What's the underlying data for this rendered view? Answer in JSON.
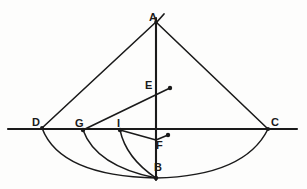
{
  "figure": {
    "canvas": {
      "width": 307,
      "height": 189
    },
    "colors": {
      "ink": "#1a1a1a",
      "background": "#fdfdfc"
    },
    "points": [
      {
        "id": "A",
        "label": "A",
        "x": 156,
        "y": 22,
        "label_x": 149,
        "label_y": 12,
        "role": "apex"
      },
      {
        "id": "D",
        "label": "D",
        "x": 42,
        "y": 128,
        "label_x": 32,
        "label_y": 117,
        "role": "left-end"
      },
      {
        "id": "C",
        "label": "C",
        "x": 268,
        "y": 129,
        "label_x": 271,
        "label_y": 117,
        "role": "right-end"
      },
      {
        "id": "G",
        "label": "G",
        "x": 83,
        "y": 130,
        "label_x": 75,
        "label_y": 118,
        "role": "arc-foot"
      },
      {
        "id": "I",
        "label": "I",
        "x": 120,
        "y": 130,
        "label_x": 117,
        "label_y": 118,
        "role": "arc-foot"
      },
      {
        "id": "E",
        "label": "E",
        "x": 170,
        "y": 88,
        "label_x": 145,
        "label_y": 80,
        "role": "ray-end"
      },
      {
        "id": "F",
        "label": "F",
        "x": 168,
        "y": 135,
        "label_x": 156,
        "label_y": 140,
        "role": "ray-end"
      },
      {
        "id": "B",
        "label": "B",
        "x": 156,
        "y": 178,
        "label_x": 154,
        "label_y": 162,
        "role": "bottom"
      }
    ],
    "segments": [
      {
        "name": "horizontal-baseline",
        "from": [
          8,
          129
        ],
        "to": [
          297,
          129
        ]
      },
      {
        "name": "vertical-axis",
        "from": [
          156,
          18
        ],
        "to": [
          156,
          180
        ]
      },
      {
        "name": "side-AD",
        "from": [
          156,
          22
        ],
        "to": [
          42,
          128
        ]
      },
      {
        "name": "side-AC",
        "from": [
          156,
          22
        ],
        "to": [
          268,
          129
        ]
      },
      {
        "name": "ray-G-to-E",
        "from": [
          83,
          130
        ],
        "to": [
          170,
          88
        ]
      },
      {
        "name": "segment-I-to-B-foot",
        "from": [
          120,
          130
        ],
        "to": [
          156,
          140
        ]
      },
      {
        "name": "segment-Bfoot-to-F",
        "from": [
          156,
          140
        ],
        "to": [
          168,
          135
        ]
      },
      {
        "name": "tick-at-A",
        "from": [
          156,
          23
        ],
        "to": [
          164,
          14
        ]
      }
    ],
    "arcs": [
      {
        "name": "arc-D-B-C",
        "d": "M 42 128 Q 60 176 156 178 Q 245 176 268 129"
      },
      {
        "name": "arc-G-B",
        "d": "M 83 130 Q 96 166 156 178"
      },
      {
        "name": "arc-I-B",
        "d": "M 120 130 Q 126 158 156 178"
      }
    ],
    "dots": [
      {
        "name": "dot-A",
        "x": 156,
        "y": 22,
        "r": 1.8
      },
      {
        "name": "dot-D",
        "x": 42,
        "y": 128,
        "r": 2.0
      },
      {
        "name": "dot-C",
        "x": 268,
        "y": 129,
        "r": 2.0
      },
      {
        "name": "dot-G",
        "x": 83,
        "y": 130,
        "r": 2.2
      },
      {
        "name": "dot-I",
        "x": 120,
        "y": 130,
        "r": 2.2
      },
      {
        "name": "dot-E",
        "x": 170,
        "y": 88,
        "r": 2.2
      },
      {
        "name": "dot-F",
        "x": 168,
        "y": 135,
        "r": 2.2
      },
      {
        "name": "dot-B",
        "x": 156,
        "y": 178,
        "r": 2.2
      }
    ]
  }
}
